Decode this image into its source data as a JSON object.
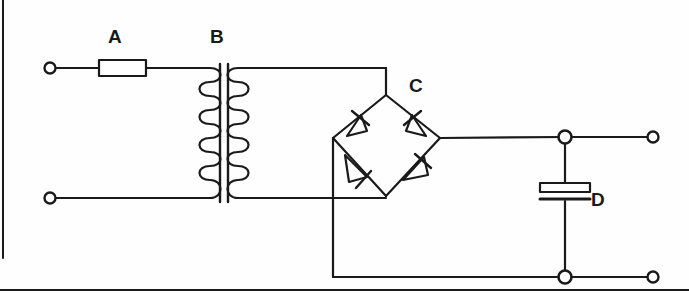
{
  "diagram": {
    "type": "schematic",
    "canvas": {
      "width": 689,
      "height": 295
    },
    "background_color": "#fefefe",
    "line_color": "#1a1a1a",
    "labels": [
      {
        "id": "A",
        "text": "A",
        "component": "fuse",
        "x": 115,
        "y": 37
      },
      {
        "id": "B",
        "text": "B",
        "component": "transformer",
        "x": 216,
        "y": 37
      },
      {
        "id": "C",
        "text": "C",
        "component": "bridge-rectifier",
        "x": 416,
        "y": 86
      },
      {
        "id": "D",
        "text": "D",
        "component": "capacitor",
        "x": 598,
        "y": 200
      }
    ],
    "components": [
      {
        "name": "fuse",
        "label": "A"
      },
      {
        "name": "transformer",
        "label": "B",
        "primary_turns": 5,
        "secondary_turns": 5
      },
      {
        "name": "bridge-rectifier",
        "label": "C",
        "diode_count": 4
      },
      {
        "name": "smoothing-capacitor",
        "label": "D",
        "plates": 2
      }
    ],
    "terminals": [
      {
        "name": "input-terminal-top",
        "x": 50,
        "y": 68
      },
      {
        "name": "input-terminal-bottom",
        "x": 50,
        "y": 198
      },
      {
        "name": "output-terminal-top",
        "x": 653,
        "y": 137
      },
      {
        "name": "output-terminal-bottom",
        "x": 653,
        "y": 277
      }
    ],
    "junctions": [
      {
        "name": "output-junction-top",
        "x": 565,
        "y": 137
      },
      {
        "name": "output-junction-bottom",
        "x": 565,
        "y": 277
      }
    ],
    "borders": {
      "left_rule": true,
      "bottom_rule": true
    }
  }
}
